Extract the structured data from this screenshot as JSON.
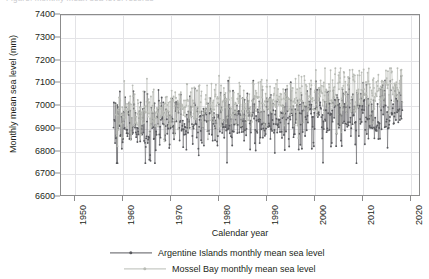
{
  "figure": {
    "top_caption": "Figure: monthly mean sea level records",
    "background": "#ffffff",
    "frame_color": "#8c8c8c",
    "grid_color": "#e3e3e6"
  },
  "axes": {
    "x": {
      "label": "Calendar year",
      "ticks": [
        1950,
        1960,
        1970,
        1980,
        1990,
        2000,
        2010,
        2020
      ],
      "min": 1947,
      "max": 2022
    },
    "y": {
      "label": "Monthly mean sea level (mm)",
      "ticks": [
        6600,
        6700,
        6800,
        6900,
        7000,
        7100,
        7200,
        7300,
        7400
      ],
      "min": 6600,
      "max": 7400
    }
  },
  "legend": {
    "position": "bottom-center",
    "entries": [
      {
        "label": "Argentine Islands monthly mean sea level",
        "color": "#595a5e",
        "marker": "circle"
      },
      {
        "label": "Mossel Bay monthly mean sea level",
        "color": "#b9bcb6",
        "marker": "circle"
      }
    ]
  },
  "chart_data": {
    "type": "line",
    "title": "",
    "xlabel": "Calendar year",
    "ylabel": "Monthly mean sea level (mm)",
    "xlim": [
      1947,
      2022
    ],
    "ylim": [
      6600,
      7400
    ],
    "grid": true,
    "x_ticks": [
      1950,
      1960,
      1970,
      1980,
      1990,
      2000,
      2010,
      2020
    ],
    "y_ticks": [
      6600,
      6700,
      6800,
      6900,
      7000,
      7100,
      7200,
      7300,
      7400
    ],
    "series": [
      {
        "name": "Argentine Islands monthly mean sea level",
        "color": "#595a5e",
        "marker": "circle",
        "x_start": 1958.0,
        "x_end": 2018.5,
        "n_points": 726,
        "trend_start": 6900,
        "trend_end": 6975,
        "noise_sd": 62,
        "y_min": 6745,
        "y_max": 7130,
        "y_mean": 6935
      },
      {
        "name": "Mossel Bay monthly mean sea level",
        "color": "#b9bcb6",
        "marker": "circle",
        "x_start": 1958.5,
        "x_end": 2018.5,
        "n_points": 720,
        "trend_start": 6955,
        "trend_end": 7075,
        "noise_sd": 48,
        "y_min": 6820,
        "y_max": 7165,
        "y_mean": 7010
      }
    ]
  }
}
